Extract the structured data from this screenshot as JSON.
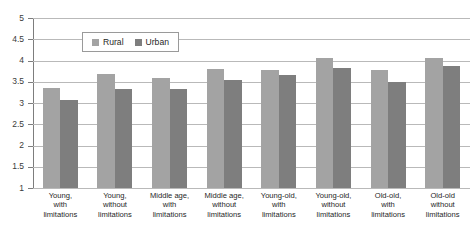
{
  "chart_data": {
    "type": "bar",
    "title": "",
    "subtitle": "",
    "xlabel": "",
    "ylabel": "",
    "ylim": [
      1,
      5
    ],
    "y_ticks": [
      "1",
      "1.5",
      "2",
      "2.5",
      "3",
      "3.5",
      "4",
      "4.5",
      "5"
    ],
    "grid": true,
    "legend_position": "top-left-inside",
    "categories": [
      "Young,\nwith\nlimitations",
      "Young,\nwithout\nlimitations",
      "Middle age,\nwith\nlimitations",
      "Middle age,\nwithout\nlimitations",
      "Young-old,\nwith\nlimitations",
      "Young-old,\nwithout\nlimitations",
      "Old-old,\nwith\nlimitations",
      "Old-old\nwithout\nlimitations"
    ],
    "series": [
      {
        "name": "Rural",
        "color": "#a3a3a3",
        "values": [
          3.35,
          3.68,
          3.6,
          3.8,
          3.78,
          4.05,
          3.77,
          4.05
        ]
      },
      {
        "name": "Urban",
        "color": "#7e7e7e",
        "values": [
          3.07,
          3.33,
          3.32,
          3.53,
          3.65,
          3.82,
          3.5,
          3.88
        ]
      }
    ]
  },
  "legend": {
    "items": [
      {
        "label": "Rural",
        "swatch": "legend-swatch-rural"
      },
      {
        "label": "Urban",
        "swatch": "legend-swatch-urban"
      }
    ]
  }
}
